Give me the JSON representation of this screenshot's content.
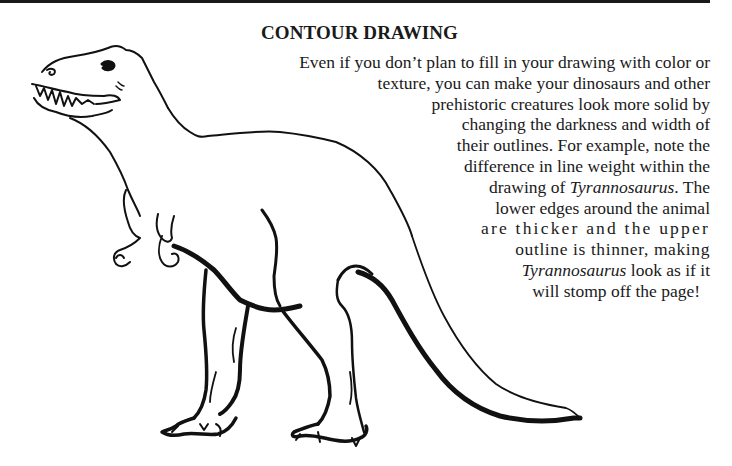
{
  "page": {
    "heading": "CONTOUR DRAWING",
    "paragraph_lines": [
      {
        "parts": [
          {
            "text": "Even if you don’t plan to fill in your drawing with color or",
            "italic": false
          }
        ]
      },
      {
        "parts": [
          {
            "text": "texture, you can make your dinosaurs and other",
            "italic": false
          }
        ]
      },
      {
        "parts": [
          {
            "text": "prehistoric creatures look more solid by",
            "italic": false
          }
        ]
      },
      {
        "parts": [
          {
            "text": "changing the darkness and width of",
            "italic": false
          }
        ]
      },
      {
        "parts": [
          {
            "text": "their outlines. For example, note the",
            "italic": false
          }
        ]
      },
      {
        "parts": [
          {
            "text": "difference in line weight within the",
            "italic": false
          }
        ]
      },
      {
        "parts": [
          {
            "text": "drawing of ",
            "italic": false
          },
          {
            "text": "Tyrannosaurus",
            "italic": true
          },
          {
            "text": ". The",
            "italic": false
          }
        ]
      },
      {
        "parts": [
          {
            "text": "lower edges around the animal",
            "italic": false
          }
        ]
      },
      {
        "parts": [
          {
            "text": "are thicker and the upper",
            "italic": false
          }
        ]
      },
      {
        "parts": [
          {
            "text": "outline is thinner, making",
            "italic": false
          }
        ]
      },
      {
        "parts": [
          {
            "text": "Tyrannosaurus",
            "italic": true
          },
          {
            "text": " look as if it",
            "italic": false
          }
        ]
      },
      {
        "parts": [
          {
            "text": "will stomp off the page!",
            "italic": false
          }
        ]
      }
    ],
    "illustration": {
      "subject": "Tyrannosaurus contour line drawing",
      "line_color": "#111111"
    }
  }
}
